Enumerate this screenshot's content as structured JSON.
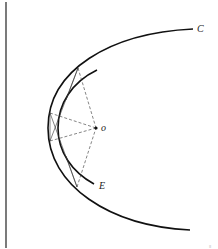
{
  "diagram": {
    "type": "geometric-construction",
    "labels": {
      "C": "C",
      "E": "E",
      "o": "o"
    },
    "corner_mark": "≡",
    "colors": {
      "stroke": "#111111",
      "dashed": "#333333",
      "background": "#ffffff"
    },
    "elements": {
      "vertical_line": {
        "x": 6,
        "y1": 2,
        "y2": 248
      },
      "outer_curve": {
        "start": [
          193,
          29
        ],
        "vertex": [
          48,
          128
        ],
        "end": [
          190,
          230
        ],
        "label": "C"
      },
      "inner_curve": {
        "start": [
          97,
          70
        ],
        "vertex": [
          58,
          128
        ],
        "end": [
          94,
          184
        ],
        "label": "E"
      },
      "center_point": {
        "x": 96,
        "y": 128,
        "label": "o"
      },
      "dashed_rays_to_o": [
        [
          78,
          68
        ],
        [
          50,
          113
        ],
        [
          50,
          141
        ],
        [
          77,
          187
        ]
      ],
      "chords": [
        [
          [
            78,
            68
          ],
          [
            50,
            141
          ]
        ],
        [
          [
            77,
            187
          ],
          [
            50,
            113
          ]
        ],
        [
          [
            50,
            113
          ],
          [
            50,
            141
          ]
        ]
      ]
    }
  }
}
